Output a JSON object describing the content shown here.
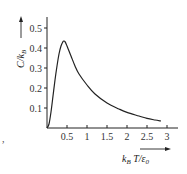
{
  "chart_data": {
    "type": "line",
    "title": "",
    "xlabel": "k_B T/ε₀",
    "ylabel": "C/k_B",
    "xlabel_parts": {
      "k": "k",
      "sub": "B",
      "rest": " T/ε",
      "sub2": "0"
    },
    "ylabel_parts": {
      "main": "C/k",
      "sub": "B"
    },
    "xlim": [
      0,
      3.1
    ],
    "ylim": [
      0,
      0.55
    ],
    "grid": false,
    "legend": null,
    "x_ticks": [
      0.5,
      1,
      1.5,
      2,
      2.5,
      3
    ],
    "x_tick_labels": [
      "0.5",
      "1",
      "1.5",
      "2",
      "2.5",
      "3"
    ],
    "y_ticks": [
      0.1,
      0.2,
      0.3,
      0.4,
      0.5
    ],
    "y_tick_labels": [
      "0.1",
      "0.2",
      "0.3",
      "0.4",
      "0.5"
    ],
    "series": [
      {
        "name": "heat capacity",
        "x": [
          0,
          0.05,
          0.1,
          0.15,
          0.2,
          0.25,
          0.3,
          0.35,
          0.4,
          0.42,
          0.45,
          0.5,
          0.6,
          0.7,
          0.8,
          1.0,
          1.2,
          1.5,
          1.8,
          2.0,
          2.3,
          2.5,
          2.7,
          2.85
        ],
        "y": [
          0,
          0.02,
          0.08,
          0.16,
          0.24,
          0.31,
          0.37,
          0.41,
          0.432,
          0.435,
          0.432,
          0.41,
          0.36,
          0.31,
          0.27,
          0.215,
          0.17,
          0.125,
          0.095,
          0.078,
          0.06,
          0.048,
          0.04,
          0.035
        ]
      }
    ]
  },
  "decor": {
    "punctuation": ","
  }
}
